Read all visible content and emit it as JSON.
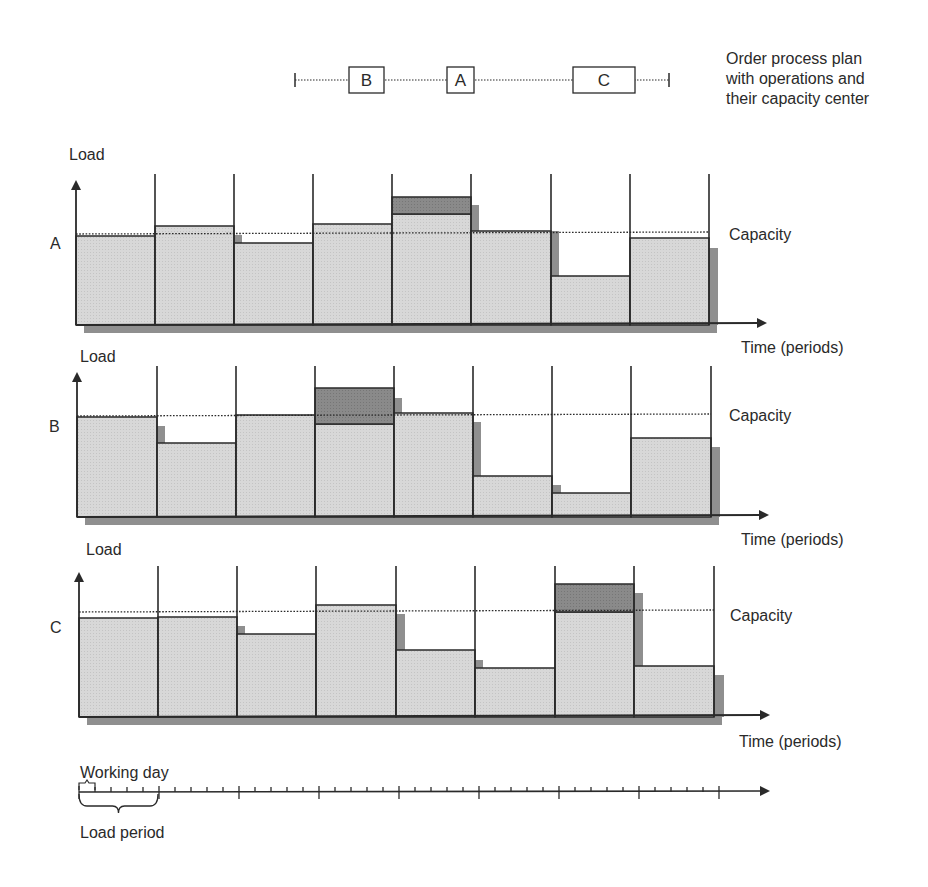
{
  "process_plan": {
    "caption_lines": [
      "Order process plan",
      "with operations and",
      "their capacity center"
    ],
    "operations": [
      {
        "label": "B",
        "x": 349,
        "w": 35
      },
      {
        "label": "A",
        "x": 447,
        "w": 27
      },
      {
        "label": "C",
        "x": 573,
        "w": 62
      }
    ],
    "line_start": 295,
    "line_end": 669,
    "y": 80
  },
  "labels": {
    "load": "Load",
    "capacity": "Capacity",
    "time": "Time (periods)",
    "working_day": "Working day",
    "load_period": "Load period"
  },
  "colors": {
    "load_fill": "#d6d6d6",
    "overload_fill": "#8a8a8a",
    "shadow": "#8f8f8f",
    "line": "#2a2a2a"
  },
  "chart_data": [
    {
      "type": "bar",
      "title": "Capacity center A",
      "center": "A",
      "xlabel": "Time (periods)",
      "ylabel": "Load",
      "categories": [
        "P1",
        "P2",
        "P3",
        "P4",
        "P5",
        "P6",
        "P7",
        "P8"
      ],
      "capacity": 100,
      "series": [
        {
          "name": "Load",
          "values": [
            98,
            109,
            90,
            111,
            122,
            103,
            54,
            96
          ]
        },
        {
          "name": "Overload (shifted)",
          "values": [
            0,
            0,
            0,
            0,
            19,
            0,
            0,
            0
          ]
        }
      ],
      "ylim": [
        0,
        160
      ]
    },
    {
      "type": "bar",
      "title": "Capacity center B",
      "center": "B",
      "xlabel": "Time (periods)",
      "ylabel": "Load",
      "categories": [
        "P1",
        "P2",
        "P3",
        "P4",
        "P5",
        "P6",
        "P7",
        "P8"
      ],
      "capacity": 100,
      "series": [
        {
          "name": "Load",
          "values": [
            99,
            73,
            101,
            92,
            103,
            40,
            23,
            78
          ]
        },
        {
          "name": "Overload (shifted)",
          "values": [
            0,
            0,
            0,
            36,
            0,
            0,
            0,
            0
          ]
        }
      ],
      "ylim": [
        0,
        140
      ]
    },
    {
      "type": "bar",
      "title": "Capacity center C",
      "center": "C",
      "xlabel": "Time (periods)",
      "ylabel": "Load",
      "categories": [
        "P1",
        "P2",
        "P3",
        "P4",
        "P5",
        "P6",
        "P7",
        "P8"
      ],
      "capacity": 100,
      "series": [
        {
          "name": "Load",
          "values": [
            94,
            95,
            79,
            107,
            64,
            47,
            100,
            49
          ]
        },
        {
          "name": "Overload (shifted)",
          "values": [
            0,
            0,
            0,
            0,
            0,
            0,
            27,
            0
          ]
        }
      ],
      "ylim": [
        0,
        140
      ]
    }
  ],
  "charts_geometry": [
    {
      "center": "A",
      "label_y": 243,
      "load_label_y": 160,
      "axis_x": 76,
      "axis_top": 182,
      "baseline": 325,
      "bounds": [
        76,
        155,
        234,
        313,
        392,
        471,
        551,
        630,
        709
      ],
      "tops": [
        236,
        226,
        243,
        224,
        214,
        231,
        276,
        238
      ],
      "over_top": [
        null,
        null,
        null,
        null,
        197,
        null,
        null,
        null
      ],
      "capacity_y": 234,
      "cap_label_y": 239,
      "time_label_y": 353,
      "arrow_end": 765,
      "shadows": [
        [
          234,
          235,
          8
        ],
        [
          471,
          205,
          8
        ],
        [
          551,
          231,
          8
        ],
        [
          709,
          248,
          9
        ]
      ],
      "shadow_bottom": 333
    },
    {
      "center": "B",
      "label_y": 432,
      "load_label_y": 362,
      "axis_x": 77,
      "axis_top": 374,
      "baseline": 517,
      "bounds": [
        77,
        157,
        236,
        315,
        394,
        473,
        552,
        631,
        711
      ],
      "tops": [
        417,
        443,
        415,
        424,
        413,
        476,
        493,
        438
      ],
      "over_top": [
        null,
        null,
        null,
        388,
        null,
        null,
        null,
        null
      ],
      "capacity_y": 416,
      "cap_label_y": 421,
      "time_label_y": 545,
      "arrow_end": 767,
      "shadows": [
        [
          157,
          426,
          8
        ],
        [
          394,
          398,
          8
        ],
        [
          473,
          422,
          8
        ],
        [
          552,
          485,
          9
        ],
        [
          711,
          447,
          9
        ]
      ],
      "shadow_bottom": 525
    },
    {
      "center": "C",
      "label_y": 633,
      "load_label_y": 555,
      "axis_x": 79,
      "axis_top": 574,
      "baseline": 717,
      "bounds": [
        79,
        158,
        237,
        316,
        396,
        475,
        555,
        634,
        714
      ],
      "tops": [
        618,
        617,
        634,
        605,
        650,
        668,
        612,
        666
      ],
      "over_top": [
        null,
        null,
        null,
        null,
        null,
        null,
        584,
        null
      ],
      "capacity_y": 612,
      "cap_label_y": 621,
      "time_label_y": 747,
      "arrow_end": 768,
      "shadows": [
        [
          237,
          626,
          8
        ],
        [
          396,
          614,
          9
        ],
        [
          475,
          660,
          8
        ],
        [
          634,
          593,
          9
        ],
        [
          714,
          675,
          10
        ]
      ],
      "shadow_bottom": 725
    }
  ],
  "timeline": {
    "y": 792,
    "x_start": 79,
    "x_end": 768,
    "minor_step": 16,
    "major_every": 5,
    "working_day_bracket": [
      79,
      95
    ],
    "load_period_bracket": [
      79,
      158
    ]
  }
}
